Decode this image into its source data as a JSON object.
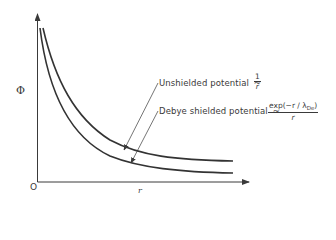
{
  "diagram": {
    "title": "",
    "axes": {
      "y_label": "Φ",
      "x_label": "r",
      "origin_label": "O"
    },
    "curves": [
      {
        "id": "unshielded",
        "label": "Unshielded potential",
        "relation": "~",
        "formula_numerator": "1",
        "formula_denominator": "r"
      },
      {
        "id": "debye",
        "label": "Debye shielded potential",
        "relation": "~",
        "formula_numerator": "exp(−r / λ",
        "formula_subscript": "De",
        "formula_numerator_close": ")",
        "formula_denominator": "r"
      }
    ],
    "colors": {
      "line": "#3a3a3a",
      "background": "#ffffff"
    }
  }
}
